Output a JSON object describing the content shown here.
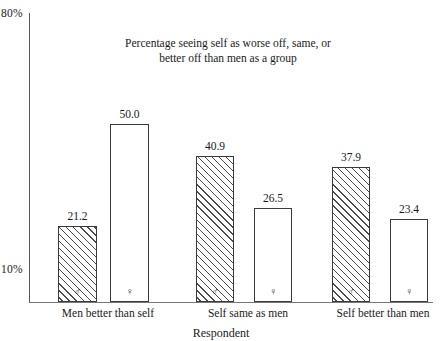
{
  "chart_data": {
    "type": "bar",
    "title": "Percentage seeing self as worse off, same, or better off than men as a group",
    "title_lines": [
      "Percentage seeing self as worse off, same, or",
      "better off than men as a group"
    ],
    "xlabel": "Respondent",
    "ylabel": "",
    "ylim": [
      0,
      80
    ],
    "grid": false,
    "legend_position": "in-bar",
    "y_ticks": [
      {
        "value": 80,
        "label": "80%"
      },
      {
        "value": 10,
        "label": "10%"
      }
    ],
    "categories": [
      "Men better than self",
      "Self same as men",
      "Self better than men"
    ],
    "series": [
      {
        "name": "Men",
        "symbol": "♂",
        "fill": "hatched",
        "values": [
          21.2,
          40.9,
          37.9
        ]
      },
      {
        "name": "Women",
        "symbol": "♀",
        "fill": "white",
        "values": [
          50.0,
          26.5,
          23.4
        ]
      }
    ],
    "bars": [
      {
        "group": "Men better than self",
        "series": "Men",
        "symbol": "♂",
        "value": 21.2,
        "label": "21.2",
        "fill": "hatched"
      },
      {
        "group": "Men better than self",
        "series": "Women",
        "symbol": "♀",
        "value": 50.0,
        "label": "50.0",
        "fill": "white"
      },
      {
        "group": "Self same as men",
        "series": "Men",
        "symbol": "♂",
        "value": 40.9,
        "label": "40.9",
        "fill": "hatched"
      },
      {
        "group": "Self same as men",
        "series": "Women",
        "symbol": "♀",
        "value": 26.5,
        "label": "26.5",
        "fill": "white"
      },
      {
        "group": "Self better than men",
        "series": "Men",
        "symbol": "♂",
        "value": 37.9,
        "label": "37.9",
        "fill": "hatched"
      },
      {
        "group": "Self better than men",
        "series": "Women",
        "symbol": "♀",
        "value": 23.4,
        "label": "23.4",
        "fill": "white"
      }
    ],
    "colors": {
      "axis": "#555555",
      "bar_outline": "#3a3a3a",
      "hatch": "#4a4a4a",
      "bar_fill": "#ffffff",
      "text": "#1a1a1a"
    }
  }
}
